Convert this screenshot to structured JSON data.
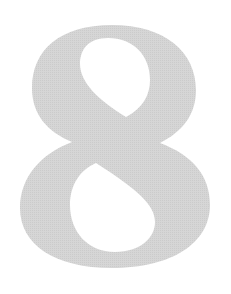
{
  "figure": {
    "digit": "8",
    "glyph_color": "#d3d3d3",
    "background_color": "#ffffff"
  }
}
